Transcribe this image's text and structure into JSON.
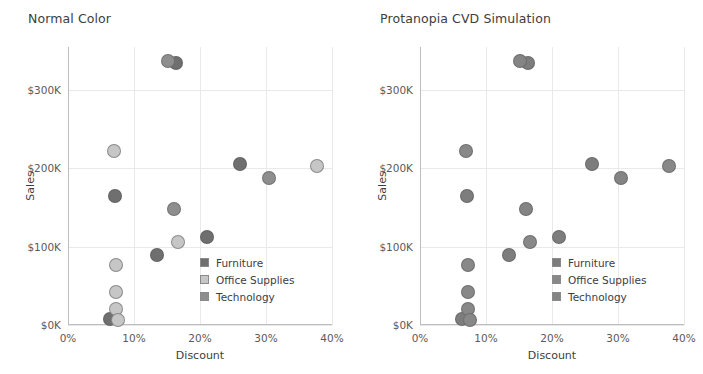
{
  "panels": [
    {
      "title": "Normal Color",
      "legend_title": "",
      "legend": [
        {
          "label": "Furniture",
          "color": "#6f6f6f"
        },
        {
          "label": "Office Supplies",
          "color": "#c6c6c6"
        },
        {
          "label": "Technology",
          "color": "#8e8e8e"
        }
      ]
    },
    {
      "title": "Protanopia CVD Simulation",
      "legend_title": "",
      "legend": [
        {
          "label": "Furniture",
          "color": "#7d7d7d"
        },
        {
          "label": "Office Supplies",
          "color": "#888888"
        },
        {
          "label": "Technology",
          "color": "#848484"
        }
      ]
    }
  ],
  "axes": {
    "x_label": "Discount",
    "y_label": "Sales",
    "x_ticks": [
      "0%",
      "10%",
      "20%",
      "30%",
      "40%"
    ],
    "y_ticks": [
      "$0K",
      "$100K",
      "$200K",
      "$300K"
    ]
  },
  "chart_data": {
    "type": "scatter",
    "xlabel": "Discount",
    "ylabel": "Sales",
    "xlim": [
      0,
      40
    ],
    "ylim": [
      0,
      355
    ],
    "x_unit": "percent",
    "y_unit": "thousand USD",
    "x_ticks": [
      0,
      10,
      20,
      30,
      40
    ],
    "y_ticks": [
      0,
      100,
      200,
      300
    ],
    "grid": true,
    "legend_position": "inside-lower-right",
    "panels": [
      "Normal Color",
      "Protanopia CVD Simulation"
    ],
    "series": [
      {
        "name": "Furniture",
        "color_normal": "#6f6f6f",
        "color_protanopia": "#7d7d7d",
        "points": [
          {
            "x": 16.4,
            "y": 335
          },
          {
            "x": 26.0,
            "y": 205
          },
          {
            "x": 7.1,
            "y": 165
          },
          {
            "x": 21.0,
            "y": 113
          },
          {
            "x": 13.5,
            "y": 90
          },
          {
            "x": 6.4,
            "y": 8
          }
        ]
      },
      {
        "name": "Office Supplies",
        "color_normal": "#c6c6c6",
        "color_protanopia": "#888888",
        "points": [
          {
            "x": 7.0,
            "y": 222
          },
          {
            "x": 37.7,
            "y": 203
          },
          {
            "x": 16.6,
            "y": 106
          },
          {
            "x": 7.2,
            "y": 77
          },
          {
            "x": 7.2,
            "y": 42
          },
          {
            "x": 7.3,
            "y": 20
          },
          {
            "x": 7.6,
            "y": 6
          }
        ]
      },
      {
        "name": "Technology",
        "color_normal": "#8e8e8e",
        "color_protanopia": "#848484",
        "points": [
          {
            "x": 15.2,
            "y": 337
          },
          {
            "x": 30.5,
            "y": 188
          },
          {
            "x": 16.0,
            "y": 148
          }
        ]
      }
    ]
  }
}
